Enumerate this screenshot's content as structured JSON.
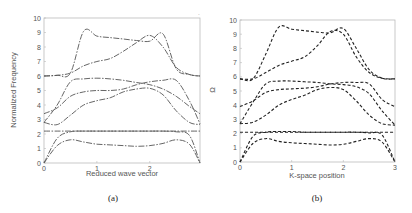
{
  "chart_data": [
    {
      "type": "line",
      "panel": "a",
      "caption": "(a)",
      "title": "",
      "xlabel": "Reduced wave vector",
      "ylabel": "Normalized Frequency",
      "xlim": [
        0,
        2.95
      ],
      "ylim": [
        0,
        10
      ],
      "xticks": [
        "0",
        "1",
        "2"
      ],
      "xtick_values": [
        0,
        1,
        2
      ],
      "yticks": [
        "0",
        "1",
        "2",
        "3",
        "4",
        "5",
        "6",
        "7",
        "8",
        "9",
        "10"
      ],
      "line_style": "dash-dot",
      "line_color": "#555555",
      "grid": false,
      "x": [
        0,
        0.25,
        0.5,
        0.75,
        1.0,
        1.25,
        1.5,
        1.75,
        2.0,
        2.25,
        2.5,
        2.75,
        2.95
      ],
      "series": [
        {
          "name": "band-1",
          "values": [
            0,
            1.2,
            1.6,
            1.45,
            1.3,
            1.25,
            1.2,
            1.15,
            1.2,
            1.35,
            1.6,
            1.3,
            0
          ]
        },
        {
          "name": "band-2",
          "values": [
            0,
            1.7,
            2.15,
            2.2,
            2.2,
            2.2,
            2.2,
            2.2,
            2.2,
            2.2,
            2.15,
            1.9,
            0
          ]
        },
        {
          "name": "band-3",
          "values": [
            2.2,
            2.2,
            2.2,
            2.2,
            2.2,
            2.2,
            2.2,
            2.2,
            2.2,
            2.2,
            2.2,
            2.2,
            2.2
          ]
        },
        {
          "name": "band-4",
          "values": [
            2.8,
            2.65,
            3.3,
            4.0,
            4.3,
            4.5,
            4.9,
            5.1,
            5.15,
            4.7,
            3.6,
            2.8,
            2.65
          ]
        },
        {
          "name": "band-5",
          "values": [
            3.4,
            3.8,
            4.6,
            4.9,
            5.0,
            5.0,
            5.1,
            5.4,
            5.6,
            5.7,
            5.7,
            4.3,
            2.7
          ]
        },
        {
          "name": "band-6",
          "values": [
            2.8,
            4.0,
            5.6,
            5.8,
            5.85,
            5.8,
            5.7,
            5.55,
            5.4,
            5.1,
            4.6,
            3.9,
            3.4
          ]
        },
        {
          "name": "band-7",
          "values": [
            6.0,
            6.05,
            6.2,
            6.7,
            7.0,
            7.2,
            7.7,
            8.3,
            8.8,
            8.0,
            6.6,
            6.1,
            6.0
          ]
        },
        {
          "name": "band-8",
          "values": [
            6.0,
            6.05,
            6.2,
            9.1,
            8.75,
            8.65,
            8.55,
            8.45,
            8.4,
            8.9,
            6.5,
            6.1,
            6.0
          ]
        }
      ]
    },
    {
      "type": "line",
      "panel": "b",
      "caption": "(b)",
      "title": "",
      "xlabel": "K-space position",
      "ylabel": "Ω",
      "xlim": [
        0,
        3
      ],
      "ylim": [
        0,
        10
      ],
      "xticks": [
        "0",
        "1",
        "2",
        "3"
      ],
      "xtick_values": [
        0,
        1,
        2,
        3
      ],
      "yticks": [
        "0",
        "1",
        "2",
        "3",
        "4",
        "5",
        "6",
        "7",
        "8",
        "9",
        "10"
      ],
      "line_style": "dashed",
      "line_color": "#222222",
      "grid": false,
      "x": [
        0,
        0.25,
        0.5,
        0.75,
        1.0,
        1.25,
        1.5,
        1.75,
        2.0,
        2.25,
        2.5,
        2.75,
        3.0
      ],
      "series": [
        {
          "name": "band-1",
          "values": [
            0,
            1.3,
            1.65,
            1.45,
            1.35,
            1.3,
            1.25,
            1.2,
            1.25,
            1.45,
            1.65,
            1.4,
            0
          ]
        },
        {
          "name": "band-2",
          "values": [
            0,
            1.8,
            2.1,
            2.15,
            2.15,
            2.1,
            2.1,
            2.1,
            2.1,
            2.1,
            2.05,
            1.9,
            0
          ]
        },
        {
          "name": "band-3",
          "values": [
            2.1,
            2.1,
            2.1,
            2.1,
            2.1,
            2.1,
            2.1,
            2.1,
            2.1,
            2.1,
            2.1,
            2.1,
            2.1
          ]
        },
        {
          "name": "band-4",
          "values": [
            2.7,
            2.8,
            3.3,
            4.0,
            4.4,
            4.7,
            5.1,
            5.25,
            5.1,
            4.3,
            3.3,
            2.7,
            2.6
          ]
        },
        {
          "name": "band-5",
          "values": [
            3.9,
            4.3,
            4.9,
            5.1,
            5.15,
            5.2,
            5.3,
            5.5,
            5.6,
            5.6,
            5.5,
            4.4,
            3.9
          ]
        },
        {
          "name": "band-6",
          "values": [
            2.7,
            4.2,
            5.5,
            5.7,
            5.7,
            5.65,
            5.6,
            5.5,
            5.45,
            5.3,
            4.8,
            3.6,
            2.6
          ]
        },
        {
          "name": "band-7",
          "values": [
            5.85,
            5.85,
            6.3,
            6.8,
            7.1,
            7.4,
            8.2,
            9.2,
            9.0,
            7.4,
            6.3,
            5.9,
            5.85
          ]
        },
        {
          "name": "band-8",
          "values": [
            5.85,
            5.85,
            7.6,
            9.5,
            9.35,
            9.25,
            9.15,
            9.1,
            9.4,
            8.0,
            6.5,
            5.9,
            5.85
          ]
        }
      ]
    }
  ]
}
